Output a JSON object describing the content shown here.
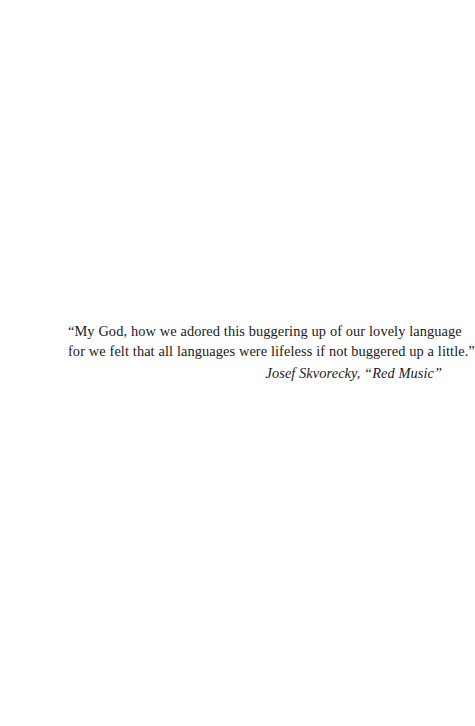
{
  "page": {
    "type": "book-epigraph-page",
    "background_color": "#ffffff",
    "text_color": "#1b1a19"
  },
  "epigraph": {
    "quote_lines": [
      "“My God, how we adored this buggering up of our lovely language",
      "for we felt that all languages were lifeless if not buggered up a little.”"
    ],
    "attribution": "Josef Skvorecky, “Red Music”"
  }
}
